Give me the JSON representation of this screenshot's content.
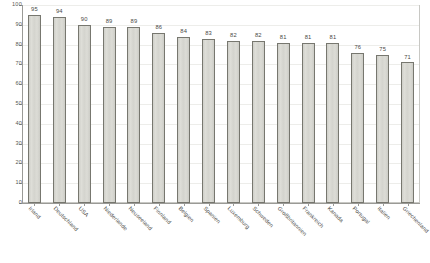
{
  "chart_data": {
    "type": "bar",
    "title": "",
    "subtitle": "",
    "xlabel": "",
    "ylabel": "",
    "ylim": [
      0,
      100
    ],
    "ytick_step": 10,
    "yticks": [
      0,
      10,
      20,
      30,
      40,
      50,
      60,
      70,
      80,
      90,
      100
    ],
    "grid": true,
    "legend": null,
    "legend_position": "none",
    "show_value_labels": true,
    "categories": [
      "Irland",
      "Deutschland",
      "USA",
      "Niederlande",
      "Neuseeland",
      "Finnland",
      "Belgien",
      "Spanien",
      "Luxemburg",
      "Schweden",
      "Großbritannien",
      "Frankreich",
      "Kanada",
      "Portugal",
      "Italien",
      "Griechenland"
    ],
    "values": [
      95,
      94,
      90,
      89,
      89,
      86,
      84,
      83,
      82,
      82,
      81,
      81,
      81,
      76,
      75,
      71
    ]
  },
  "style": {
    "bar_fill": "#d7d7d1",
    "bar_border": "#77776f",
    "axis_color": "#9a9a96",
    "grid_color": "#ededea",
    "text_color": "#4a4a46",
    "background": "#ffffff"
  }
}
